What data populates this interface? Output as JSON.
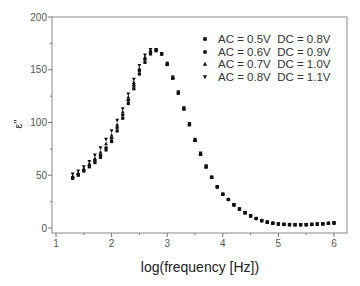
{
  "chart_data": {
    "type": "scatter",
    "title": "",
    "xlabel": "log(frequency [Hz])",
    "ylabel": "ε''",
    "xlim": [
      0.93,
      6.2
    ],
    "ylim": [
      -2,
      200
    ],
    "xticks": [
      1,
      2,
      3,
      4,
      5,
      6
    ],
    "xtick_labels": [
      "1",
      "2",
      "3",
      "4",
      "5",
      "6"
    ],
    "xminor_ticks": [
      1.5,
      2.5,
      3.5,
      4.5,
      5.5
    ],
    "yticks": [
      0,
      50,
      100,
      150,
      200
    ],
    "ytick_labels": [
      "0",
      "50",
      "100",
      "150",
      "200"
    ],
    "yminor_ticks": [
      25,
      75,
      125,
      175
    ],
    "grid": false,
    "legend_position": "top-right",
    "x": [
      1.3,
      1.4,
      1.5,
      1.6,
      1.7,
      1.8,
      1.9,
      2.0,
      2.1,
      2.2,
      2.3,
      2.4,
      2.5,
      2.6,
      2.7,
      2.8,
      2.9,
      3.0,
      3.1,
      3.2,
      3.3,
      3.4,
      3.5,
      3.6,
      3.7,
      3.8,
      3.9,
      4.0,
      4.1,
      4.2,
      4.3,
      4.4,
      4.5,
      4.6,
      4.7,
      4.8,
      4.9,
      5.0,
      5.1,
      5.2,
      5.3,
      5.4,
      5.5,
      5.6,
      5.7,
      5.8,
      5.9,
      6.0
    ],
    "series": [
      {
        "name": "AC = 0.5V  DC = 0.8V",
        "marker": "square",
        "values": [
          47,
          50,
          54,
          58,
          62,
          67,
          74,
          82,
          92,
          104,
          118,
          132,
          146,
          157,
          165,
          168,
          165,
          155,
          142,
          128,
          113,
          98,
          83,
          70,
          58,
          48,
          39,
          32,
          27,
          22,
          18,
          14.5,
          11.5,
          9,
          7,
          5.5,
          4.5,
          3.8,
          3.4,
          3.2,
          3.1,
          3.1,
          3.2,
          3.4,
          3.7,
          4,
          4.4,
          4.8
        ]
      },
      {
        "name": "AC = 0.6V  DC = 0.9V",
        "marker": "circle",
        "values": [
          48,
          51,
          55,
          59,
          64,
          69,
          76,
          85,
          95,
          107,
          121,
          135,
          149,
          160,
          167,
          169,
          165,
          155,
          142,
          128,
          113,
          98,
          83,
          70,
          58,
          48,
          39,
          32,
          27,
          22,
          18,
          14.5,
          11.5,
          9,
          7,
          5.5,
          4.5,
          3.8,
          3.4,
          3.2,
          3.1,
          3.1,
          3.2,
          3.4,
          3.7,
          4,
          4.4,
          4.8
        ]
      },
      {
        "name": "AC = 0.7V  DC = 1.0V",
        "marker": "triangle-up",
        "values": [
          49,
          52,
          56,
          61,
          66,
          72,
          80,
          88,
          98,
          110,
          124,
          138,
          151,
          162,
          168,
          169,
          165,
          156,
          143,
          128,
          113,
          98,
          83,
          70,
          58,
          48,
          39,
          32,
          27,
          22,
          18,
          14.5,
          11.5,
          9,
          7,
          5.5,
          4.5,
          3.8,
          3.4,
          3.2,
          3.1,
          3.1,
          3.2,
          3.4,
          3.7,
          4,
          4.4,
          4.8
        ]
      },
      {
        "name": "AC = 0.8V  DC = 1.1V",
        "marker": "triangle-down",
        "values": [
          51,
          54,
          58,
          63,
          69,
          76,
          84,
          92,
          102,
          113,
          127,
          141,
          154,
          164,
          169,
          169,
          165,
          156,
          143,
          129,
          114,
          99,
          84,
          71,
          59,
          48,
          39,
          32,
          27,
          22,
          18,
          14.5,
          11.5,
          9,
          7,
          5.5,
          4.5,
          3.8,
          3.4,
          3.2,
          3.1,
          3.1,
          3.2,
          3.4,
          3.7,
          4,
          4.4,
          4.8
        ]
      }
    ],
    "colors": {
      "axis": "#777777",
      "marker": "#111111",
      "text": "#333333"
    }
  }
}
